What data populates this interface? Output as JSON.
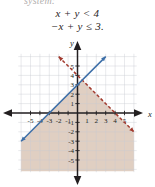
{
  "figure": {
    "heading": "system:",
    "equation_1": "x + y < 4",
    "equation_2": "−x + y ≤ 3."
  },
  "chart_data": {
    "type": "line",
    "title": "",
    "subtitle": "",
    "xlabel": "x",
    "ylabel": "y",
    "xlim": [
      -6.2,
      6.2
    ],
    "ylim": [
      -6.2,
      6.2
    ],
    "grid": true,
    "grid_color": "#c9ccd4",
    "legend": "none",
    "xticks": [
      -5,
      -4,
      -3,
      -2,
      -1,
      1,
      2,
      3,
      4,
      5
    ],
    "yticks": [
      5,
      4,
      3,
      2,
      1,
      -1,
      -2,
      -3,
      -4,
      -5
    ],
    "xtick_labels": [
      "-5",
      "-4",
      "-3",
      "-2",
      "-1",
      "1",
      "2",
      "3",
      "4",
      "5"
    ],
    "ytick_labels": [
      "5",
      "4",
      "3",
      "2",
      "1",
      "-1",
      "-2",
      "-3",
      "-4",
      "-5"
    ],
    "series": [
      {
        "name": "x + y < 4",
        "equation": "y = -x + 4",
        "slope": -1,
        "intercept": 4,
        "style": "dashed",
        "color": "#a23a2e",
        "inequality": "<",
        "shade": "below",
        "arrows": "both",
        "points": [
          [
            -2,
            6
          ],
          [
            6,
            -2
          ]
        ]
      },
      {
        "name": "-x + y ≤ 3",
        "equation": "y = x + 3",
        "slope": 1,
        "intercept": 3,
        "style": "solid",
        "color": "#3d6fa8",
        "inequality": "≤",
        "shade": "below",
        "arrows": "both",
        "points": [
          [
            -6,
            -3
          ],
          [
            3,
            6
          ]
        ]
      }
    ],
    "shaded_region": {
      "description": "solution set: intersection of y < -x + 4 and y ≤ x + 3",
      "fill": "#d6bfae",
      "opacity": 0.75,
      "vertices": [
        [
          -6,
          -3
        ],
        [
          0.5,
          3.5
        ],
        [
          6,
          -2
        ],
        [
          6,
          -6.2
        ],
        [
          -6,
          -6.2
        ]
      ]
    },
    "axis_color": "#231f20"
  }
}
